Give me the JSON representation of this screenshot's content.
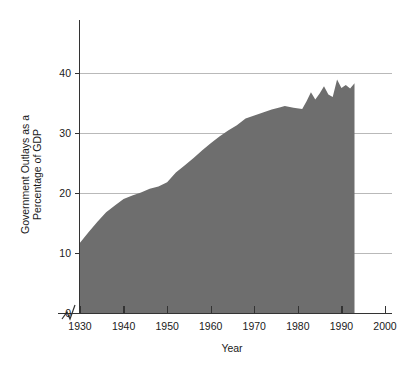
{
  "chart_data": {
    "type": "area",
    "title": "",
    "subtitle": "",
    "xlabel": "Year",
    "ylabel": "Government Outlays as a Percentage of GDP",
    "ylabel_line1": "Government Outlays as a",
    "ylabel_line2": "Percentage of GDP",
    "xlim": [
      1926,
      2002
    ],
    "ylim": [
      0,
      43
    ],
    "xticks": [
      1930,
      1940,
      1950,
      1960,
      1970,
      1980,
      1990,
      2000
    ],
    "xtick_labels": [
      "1930",
      "1940",
      "1950",
      "1960",
      "1970",
      "1980",
      "1990",
      "2000"
    ],
    "yticks": [
      0,
      10,
      20,
      30,
      40
    ],
    "ytick_labels": [
      "0",
      "10",
      "20",
      "30",
      "40"
    ],
    "grid": "horizontal",
    "legend": "none",
    "axis_break": true,
    "fill_color": "#6e6e6e",
    "grid_color": "#b9b9b9",
    "axis_color": "#333333",
    "x": [
      1930,
      1932,
      1934,
      1936,
      1938,
      1940,
      1942,
      1944,
      1946,
      1948,
      1950,
      1952,
      1954,
      1956,
      1958,
      1960,
      1962,
      1964,
      1966,
      1968,
      1970,
      1972,
      1974,
      1976,
      1977,
      1979,
      1981,
      1982,
      1983,
      1984,
      1985,
      1986,
      1987,
      1988,
      1989,
      1990,
      1991,
      1992,
      1993
    ],
    "values": [
      11.7,
      13.5,
      15.2,
      16.8,
      17.9,
      19.0,
      19.6,
      20.1,
      20.7,
      21.1,
      21.8,
      23.4,
      24.6,
      25.8,
      27.1,
      28.3,
      29.4,
      30.4,
      31.3,
      32.4,
      32.9,
      33.4,
      33.9,
      34.3,
      34.5,
      34.2,
      34.0,
      35.3,
      36.8,
      35.6,
      36.6,
      37.8,
      36.4,
      36.0,
      38.9,
      37.5,
      38.0,
      37.4,
      38.3
    ]
  },
  "axes": {
    "x_axis_name": "year-axis",
    "y_axis_name": "percent-of-gdp-axis"
  }
}
